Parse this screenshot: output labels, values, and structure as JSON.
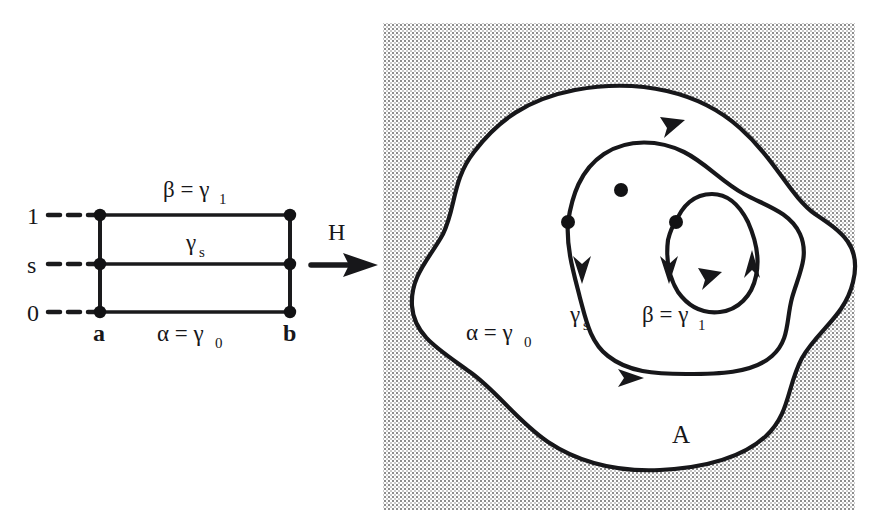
{
  "figure": {
    "caption_present": false,
    "background_color": "#ffffff",
    "ink_color": "#17171a",
    "shade_color": "#9a9a9a"
  },
  "left_diagram": {
    "name": "homotopy-domain-rectangle",
    "axis_ticks": [
      {
        "label": "1",
        "value": 1
      },
      {
        "label": "s",
        "value": 0.5
      },
      {
        "label": "0",
        "value": 0
      }
    ],
    "corner_labels": {
      "left": "a",
      "right": "b"
    },
    "top_edge_label": "β = γ",
    "top_edge_sub": "1",
    "middle_edge_label": "γ",
    "middle_edge_sub": "s",
    "bottom_edge_label": "α = γ",
    "bottom_edge_sub": "0"
  },
  "map_arrow": {
    "label": "H",
    "direction": "right"
  },
  "right_diagram": {
    "name": "homotopy-image-region",
    "region_label": "A",
    "curve_labels": [
      {
        "text": "α = γ",
        "sub": "0",
        "curve": "outer"
      },
      {
        "text": "γ",
        "sub": "s",
        "curve": "middle"
      },
      {
        "text": "β = γ",
        "sub": "1",
        "curve": "inner"
      }
    ],
    "basepoint_count": 3,
    "arrow_count": 6,
    "shaded_background": true
  }
}
